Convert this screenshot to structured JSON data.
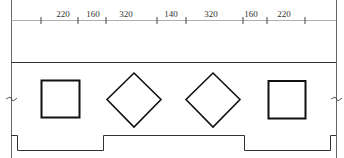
{
  "drawing": {
    "type": "architectural-elevation",
    "stroke_color": "#222222",
    "thin_color": "#555555",
    "dimensions": {
      "labels": [
        "220",
        "160",
        "320",
        "140",
        "320",
        "160",
        "220"
      ],
      "label_positions_x": [
        63,
        93,
        126,
        171,
        211,
        251,
        284
      ],
      "tick_positions_x": [
        41,
        78,
        106,
        157,
        186,
        243,
        267,
        305
      ]
    },
    "shapes": [
      {
        "kind": "square",
        "label": "square-opening-left"
      },
      {
        "kind": "diamond",
        "label": "diamond-opening-left"
      },
      {
        "kind": "diamond",
        "label": "diamond-opening-right"
      },
      {
        "kind": "square",
        "label": "square-opening-right"
      }
    ]
  }
}
